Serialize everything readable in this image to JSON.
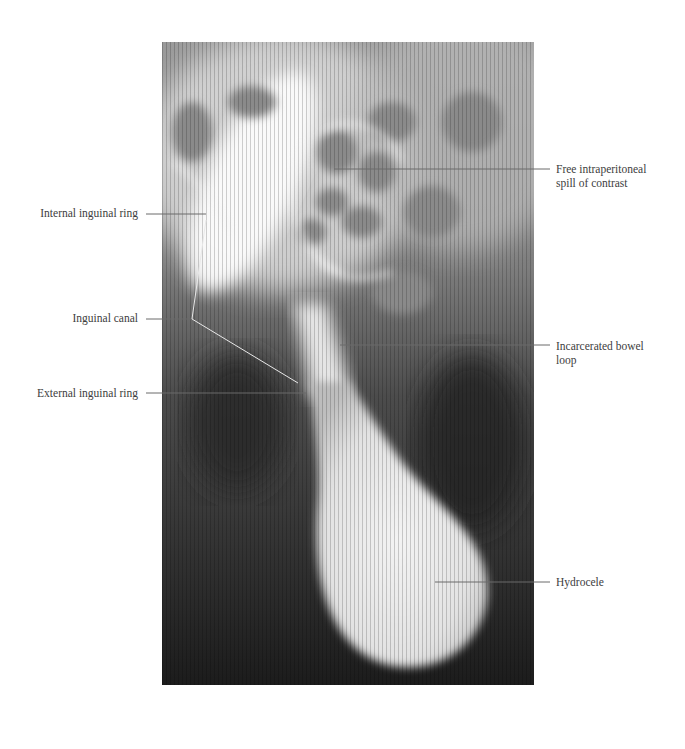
{
  "figure": {
    "labels_left": [
      {
        "id": "internal-inguinal-ring",
        "text": "Internal inguinal ring"
      },
      {
        "id": "inguinal-canal",
        "text": "Inguinal canal"
      },
      {
        "id": "external-inguinal-ring",
        "text": "External inguinal ring"
      }
    ],
    "labels_right": [
      {
        "id": "free-intraperitoneal-spill",
        "line1": "Free intraperitoneal",
        "line2": "spill of contrast"
      },
      {
        "id": "incarcerated-bowel-loop",
        "line1": "Incarcerated bowel",
        "line2": "loop"
      },
      {
        "id": "hydrocele",
        "line1": "Hydrocele",
        "line2": ""
      }
    ]
  },
  "colors": {
    "background": "#ffffff",
    "leader_line": "#6b6b6b",
    "label_text": "#3d3d3d"
  }
}
